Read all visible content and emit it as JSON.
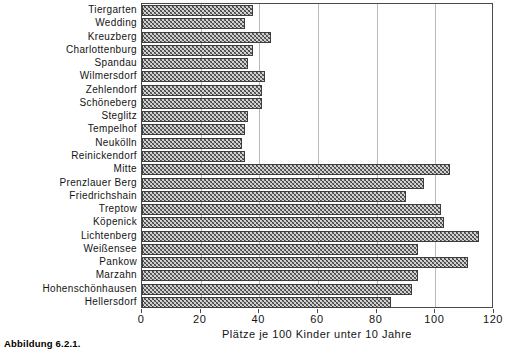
{
  "figure": {
    "caption": "Abbildung 6.2.1."
  },
  "chart_data": {
    "type": "bar",
    "orientation": "horizontal",
    "title": "",
    "xlabel": "Plätze je 100 Kinder unter 10 Jahre",
    "ylabel": "",
    "xlim": [
      0,
      120
    ],
    "xticks": [
      0,
      20,
      40,
      60,
      80,
      100,
      120
    ],
    "xtick_labels": [
      "0",
      "20",
      "40",
      "60",
      "80",
      "100",
      "120"
    ],
    "grid": "vertical",
    "legend": "none",
    "bar_color": "#d2d2d2",
    "bar_edge_color": "#3d3d3d",
    "bar_pattern": "crosshatch",
    "categories": [
      "Tiergarten",
      "Wedding",
      "Kreuzberg",
      "Charlottenburg",
      "Spandau",
      "Wilmersdorf",
      "Zehlendorf",
      "Schöneberg",
      "Steglitz",
      "Tempelhof",
      "Neukölln",
      "Reinickendorf",
      "Mitte",
      "Prenzlauer Berg",
      "Friedrichshain",
      "Treptow",
      "Köpenick",
      "Lichtenberg",
      "Weißensee",
      "Pankow",
      "Marzahn",
      "Hohenschönhausen",
      "Hellersdorf"
    ],
    "values": [
      38,
      35,
      44,
      38,
      36,
      42,
      41,
      41,
      36,
      35,
      34,
      35,
      105,
      96,
      90,
      102,
      103,
      115,
      94,
      111,
      94,
      92,
      85
    ]
  }
}
